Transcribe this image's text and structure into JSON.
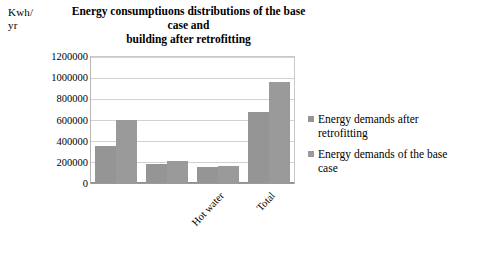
{
  "chart_data": {
    "type": "bar",
    "title": "Energy consumptiuons distributions of the base case and building after retrofitting",
    "title_line1": "Energy consumptiuons distributions of the base case and",
    "title_line2": "building after retrofitting",
    "axis_unit_line1": "Kwh/",
    "axis_unit_line2": "yr",
    "xlabel": "",
    "ylabel": "Kwh/ yr",
    "categories": [
      "",
      "",
      "Hot water",
      "Total"
    ],
    "series": [
      {
        "name": "Energy demands after retrofitting",
        "values": [
          350000,
          185000,
          155000,
          680000
        ]
      },
      {
        "name": "Energy demands of the base case",
        "values": [
          600000,
          210000,
          165000,
          960000
        ]
      }
    ],
    "ylim": [
      0,
      1200000
    ],
    "yticks": [
      0,
      200000,
      400000,
      600000,
      800000,
      1000000,
      1200000
    ],
    "ytick_labels": [
      "0",
      "200000",
      "400000",
      "600000",
      "800000",
      "1000000",
      "1200000"
    ],
    "grid": true,
    "legend_position": "right",
    "colors": {
      "series_after_retrofitting": "#959595",
      "series_base_case": "#9a9a9a",
      "gridline": "#d2d2d2",
      "axis": "#8f8f8f",
      "background": "#ffffff",
      "text": "#000000"
    }
  },
  "legend": {
    "items": [
      {
        "label": "Energy demands after retrofitting"
      },
      {
        "label": "Energy demands of the base case"
      }
    ]
  }
}
